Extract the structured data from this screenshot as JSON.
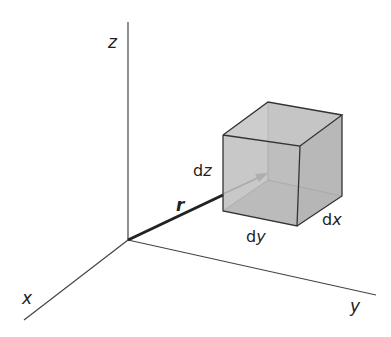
{
  "diagram": {
    "axes": {
      "z_label": "z",
      "x_label": "x",
      "y_label": "y"
    },
    "vector_label": "r",
    "cube": {
      "dz_prefix": "d",
      "dz_var": "z",
      "dy_prefix": "d",
      "dy_var": "y",
      "dx_prefix": "d",
      "dx_var": "x",
      "fill_color": "#b8b8b8",
      "edge_color": "#333333"
    }
  }
}
